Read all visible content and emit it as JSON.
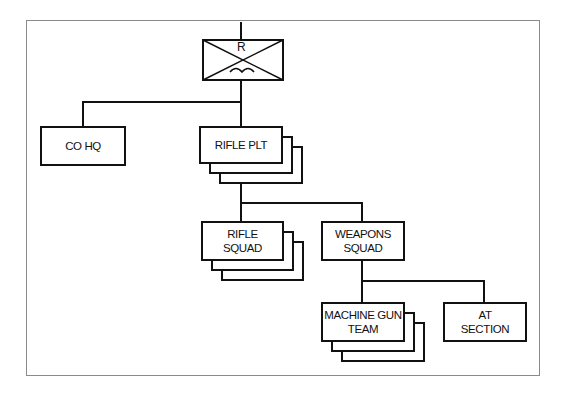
{
  "diagram": {
    "type": "military organization chart",
    "root": {
      "symbol": "infantry-recon-unit-symbol",
      "symbol_letter": "R"
    },
    "nodes": [
      {
        "id": "co_hq",
        "label": "CO HQ",
        "stacked": false
      },
      {
        "id": "rifle_plt",
        "label": "RIFLE PLT",
        "stacked": true
      },
      {
        "id": "rifle_squad",
        "label": "RIFLE\nSQUAD",
        "stacked": true
      },
      {
        "id": "weapons_squad",
        "label": "WEAPONS\nSQUAD",
        "stacked": false
      },
      {
        "id": "mg_team",
        "label": "MACHINE GUN\nTEAM",
        "stacked": true
      },
      {
        "id": "at_section",
        "label": "AT\nSECTION",
        "stacked": false
      }
    ],
    "edges": [
      [
        "root",
        "co_hq"
      ],
      [
        "root",
        "rifle_plt"
      ],
      [
        "rifle_plt",
        "rifle_squad"
      ],
      [
        "rifle_plt",
        "weapons_squad"
      ],
      [
        "weapons_squad",
        "mg_team"
      ],
      [
        "weapons_squad",
        "at_section"
      ]
    ]
  }
}
